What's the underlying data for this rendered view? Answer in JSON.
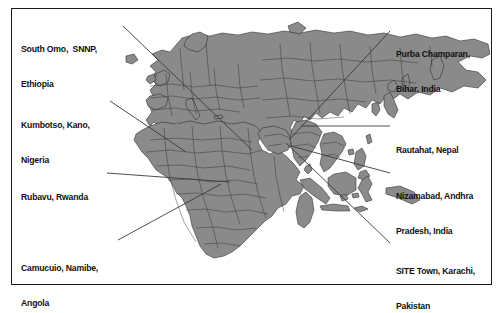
{
  "figure": {
    "type": "map",
    "colors": {
      "land_fill": "#8a8a8a",
      "land_border": "#2b2b2b",
      "ocean_fill": "#ffffff",
      "frame_border": "#1a1a1a",
      "leader_line": "#3a3a3a",
      "label_text": "#111111"
    },
    "frame": {
      "x": 11,
      "y": 8,
      "width": 481,
      "height": 277
    }
  },
  "labels": [
    {
      "id": "south-omo",
      "side": "left",
      "lines": [
        "South Omo,  SNNP,",
        "Ethiopia"
      ],
      "text_x": 21,
      "text_y": 21,
      "leader": {
        "x1": 123,
        "y1": 26,
        "x2": 252,
        "y2": 150
      }
    },
    {
      "id": "kumbotso-kano",
      "side": "left",
      "lines": [
        "Kumbotso, Kano,",
        "Nigeria"
      ],
      "text_x": 21,
      "text_y": 97,
      "leader": {
        "x1": 110,
        "y1": 101,
        "x2": 186,
        "y2": 152
      }
    },
    {
      "id": "rubavu",
      "side": "left",
      "lines": [
        "Rubavu, Rwanda"
      ],
      "text_x": 21,
      "text_y": 169,
      "leader": {
        "x1": 107,
        "y1": 173,
        "x2": 230,
        "y2": 182
      }
    },
    {
      "id": "camucuio",
      "side": "left",
      "lines": [
        "Camucuio, Namibe,",
        "Angola"
      ],
      "text_x": 21,
      "text_y": 240,
      "leader": {
        "x1": 118,
        "y1": 240,
        "x2": 221,
        "y2": 184
      }
    },
    {
      "id": "purba-champaran",
      "side": "right",
      "lines": [
        "Purba Champaran,",
        "Bihar, India"
      ],
      "text_x": 396,
      "text_y": 26,
      "leader": {
        "x1": 390,
        "y1": 31,
        "x2": 289,
        "y2": 140
      }
    },
    {
      "id": "rautahat",
      "side": "right",
      "lines": [
        "Rautahat, Nepal"
      ],
      "text_x": 396,
      "text_y": 122,
      "leader": {
        "x1": 390,
        "y1": 126,
        "x2": 301,
        "y2": 126
      }
    },
    {
      "id": "nizamabad",
      "side": "right",
      "lines": [
        "Nizamabad, Andhra",
        "Pradesh, India"
      ],
      "text_x": 396,
      "text_y": 168,
      "leader": {
        "x1": 390,
        "y1": 173,
        "x2": 291,
        "y2": 146
      }
    },
    {
      "id": "site-town-karachi",
      "side": "right",
      "lines": [
        "SITE Town, Karachi,",
        "Pakistan"
      ],
      "text_x": 396,
      "text_y": 243,
      "leader": {
        "x1": 390,
        "y1": 243,
        "x2": 286,
        "y2": 143
      }
    }
  ]
}
